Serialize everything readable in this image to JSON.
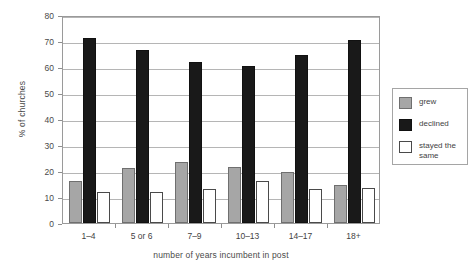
{
  "chart_data": {
    "type": "bar",
    "title": "",
    "xlabel": "number of years incumbent in post",
    "ylabel": "% of churches",
    "ylim": [
      0,
      80
    ],
    "yticks": [
      0,
      10,
      20,
      30,
      40,
      50,
      60,
      70,
      80
    ],
    "grid": true,
    "legend_position": "right",
    "categories": [
      "1–4",
      "5 or 6",
      "7–9",
      "10–13",
      "14–17",
      "18+"
    ],
    "series": [
      {
        "name": "grew",
        "color": "#a6a6a6",
        "values": [
          16,
          21,
          23.5,
          21.5,
          19.5,
          14.5
        ]
      },
      {
        "name": "declined",
        "color": "#191919",
        "values": [
          71,
          66.5,
          62,
          60.5,
          64.5,
          70.5
        ]
      },
      {
        "name": "stayed the\nsame",
        "color": "#ffffff",
        "values": [
          12,
          12,
          13,
          16,
          13,
          13.5
        ]
      }
    ]
  },
  "legend": {
    "items": [
      {
        "label": "grew"
      },
      {
        "label": "declined"
      },
      {
        "label": "stayed the\nsame"
      }
    ]
  }
}
